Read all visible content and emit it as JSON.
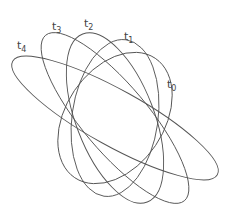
{
  "diagram": {
    "stroke_color": "#555555",
    "center": [
      115,
      118
    ],
    "ellipses": [
      {
        "label_base": "t",
        "label_sub": "0",
        "rx": 72,
        "ry": 49,
        "angle": -56,
        "label_pos": [
          167,
          88
        ]
      },
      {
        "label_base": "t",
        "label_sub": "1",
        "rx": 79,
        "ry": 43,
        "angle": -82,
        "label_pos": [
          124,
          40
        ]
      },
      {
        "label_base": "t",
        "label_sub": "2",
        "rx": 90,
        "ry": 39,
        "angle": 69,
        "label_pos": [
          84,
          27
        ]
      },
      {
        "label_base": "t",
        "label_sub": "3",
        "rx": 108,
        "ry": 33,
        "angle": 50,
        "label_pos": [
          52,
          30
        ]
      },
      {
        "label_base": "t",
        "label_sub": "4",
        "rx": 117,
        "ry": 28,
        "angle": 29,
        "label_pos": [
          17,
          49
        ]
      }
    ]
  }
}
